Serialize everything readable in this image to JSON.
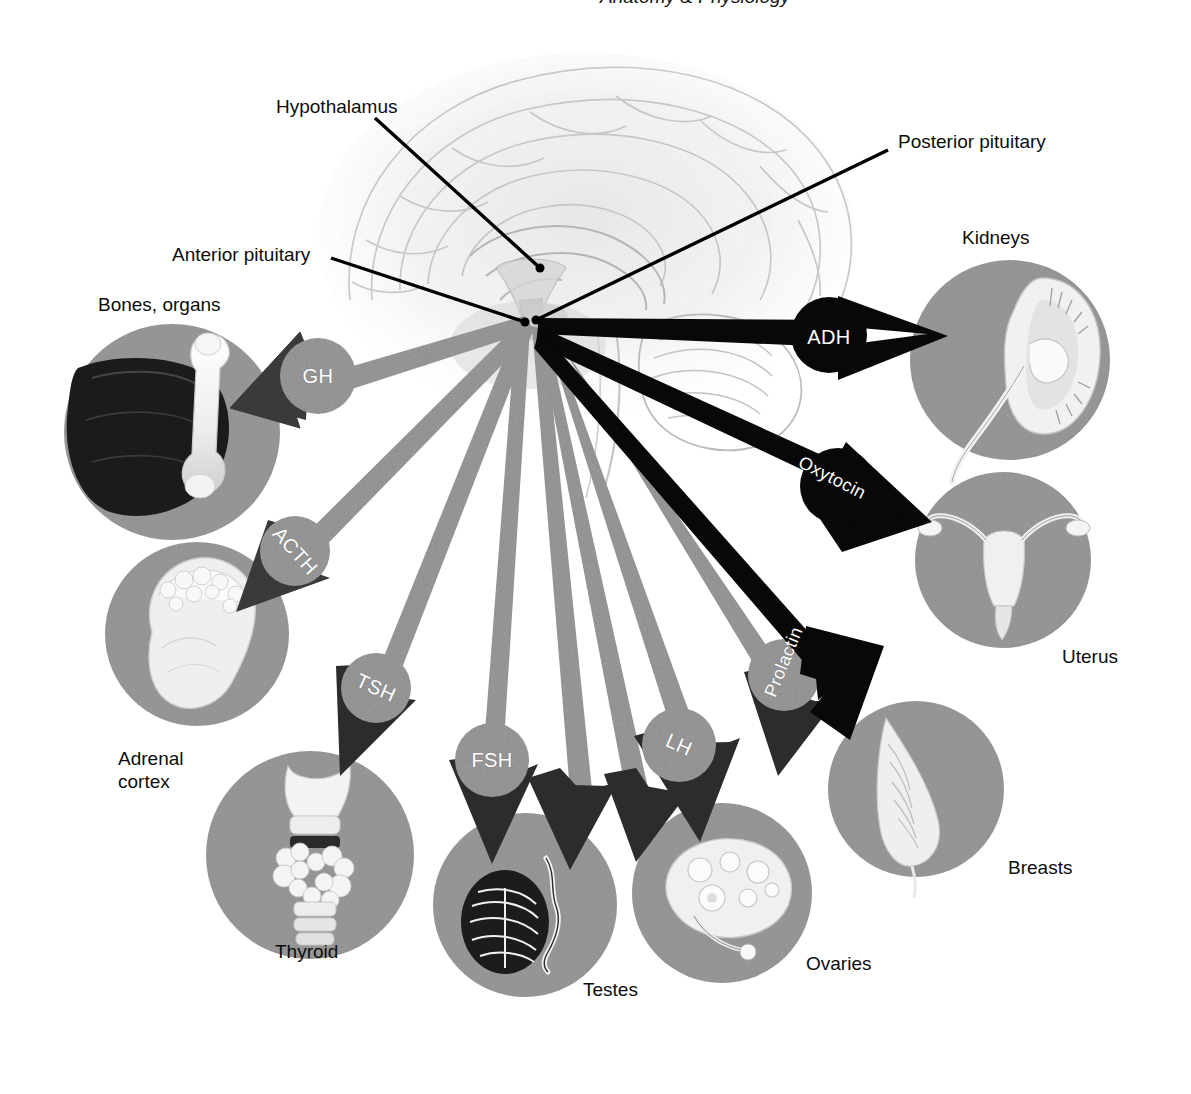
{
  "page": {
    "header_partial_text": "Anatomy & Physiology",
    "background_color": "#ffffff"
  },
  "palette": {
    "organ_circle_gray": "#919191",
    "anterior_shaft_gray": "#8e8e8e",
    "anterior_arrowhead": "#3a3a3a",
    "posterior_black": "#080808",
    "leader_line": "#000000",
    "label_text": "#0d0d0d",
    "hormone_text": "#ffffff"
  },
  "anatomy": {
    "brain_label": "brain-sagittal-section",
    "pituitary_hub": {
      "x": 530,
      "y": 322
    }
  },
  "leader_labels": [
    {
      "id": "hypothalamus",
      "text": "Hypothalamus",
      "x": 276,
      "y": 95,
      "line": {
        "x1": 375,
        "y1": 118,
        "x2": 540,
        "y2": 268
      }
    },
    {
      "id": "anterior-pituitary",
      "text": "Anterior pituitary",
      "x": 172,
      "y": 243,
      "line": {
        "x1": 331,
        "y1": 258,
        "x2": 525,
        "y2": 322
      }
    },
    {
      "id": "posterior-pituitary",
      "text": "Posterior pituitary",
      "x": 898,
      "y": 130,
      "line": {
        "x1": 888,
        "y1": 150,
        "x2": 536,
        "y2": 320
      }
    }
  ],
  "organs": [
    {
      "id": "bones-organs",
      "label": "Bones, organs",
      "label_x": 98,
      "label_y": 293,
      "cx": 172,
      "cy": 432,
      "r": 108,
      "art": "liver-and-femur"
    },
    {
      "id": "adrenal-cortex",
      "label": "Adrenal\ncortex",
      "label_x": 118,
      "label_y": 757,
      "cx": 197,
      "cy": 634,
      "r": 92,
      "art": "adrenal-gland-kidney"
    },
    {
      "id": "thyroid",
      "label": "Thyroid",
      "label_x": 275,
      "label_y": 940,
      "cx": 310,
      "cy": 855,
      "r": 104,
      "art": "thyroid-gland"
    },
    {
      "id": "testes",
      "label": "Testes",
      "label_x": 583,
      "label_y": 978,
      "cx": 525,
      "cy": 905,
      "r": 92,
      "art": "testis-epididymis"
    },
    {
      "id": "ovaries",
      "label": "Ovaries",
      "label_x": 806,
      "label_y": 952,
      "cx": 722,
      "cy": 893,
      "r": 90,
      "art": "ovary-follicles"
    },
    {
      "id": "breasts",
      "label": "Breasts",
      "label_x": 1008,
      "label_y": 856,
      "cx": 916,
      "cy": 789,
      "r": 88,
      "art": "breast-cross-section"
    },
    {
      "id": "uterus",
      "label": "Uterus",
      "label_x": 1062,
      "label_y": 645,
      "cx": 1003,
      "cy": 560,
      "r": 88,
      "art": "uterus-fallopian-tubes"
    },
    {
      "id": "kidneys",
      "label": "Kidneys",
      "label_x": 962,
      "label_y": 226,
      "cx": 1010,
      "cy": 360,
      "r": 100,
      "art": "kidney-cross-section"
    }
  ],
  "hormones": [
    {
      "id": "gh",
      "name": "GH",
      "source": "Anterior pituitary",
      "target": "Bones, organs",
      "style": "anterior",
      "capsule": {
        "cx": 318,
        "cy": 376,
        "r": 38
      },
      "text_rot": 0,
      "text_x": 318,
      "text_y": 376
    },
    {
      "id": "acth",
      "name": "ACTH",
      "source": "Anterior pituitary",
      "target": "Adrenal cortex",
      "style": "anterior",
      "capsule": {
        "cx": 295,
        "cy": 551,
        "r": 35
      },
      "text_rot": 48,
      "text_x": 295,
      "text_y": 551
    },
    {
      "id": "tsh",
      "name": "TSH",
      "source": "Anterior pituitary",
      "target": "Thyroid",
      "style": "anterior",
      "capsule": {
        "cx": 376,
        "cy": 688,
        "r": 35
      },
      "text_rot": 24,
      "text_x": 376,
      "text_y": 688
    },
    {
      "id": "fsh",
      "name": "FSH",
      "source": "Anterior pituitary",
      "target": "Testes, Ovaries",
      "style": "anterior",
      "capsule": {
        "cx": 492,
        "cy": 760,
        "r": 37
      },
      "text_rot": 0,
      "text_x": 492,
      "text_y": 760
    },
    {
      "id": "lh",
      "name": "LH",
      "source": "Anterior pituitary",
      "target": "Ovaries, Testes",
      "style": "anterior",
      "capsule": {
        "cx": 679,
        "cy": 745,
        "r": 37
      },
      "text_rot": 24,
      "text_x": 679,
      "text_y": 745
    },
    {
      "id": "prolactin",
      "name": "Prolactin",
      "source": "Anterior pituitary",
      "target": "Breasts",
      "style": "anterior",
      "capsule": {
        "cx": 784,
        "cy": 675,
        "r": 36
      },
      "text_rot": -68,
      "text_x": 784,
      "text_y": 662
    },
    {
      "id": "adh",
      "name": "ADH",
      "source": "Posterior pituitary",
      "target": "Kidneys",
      "style": "posterior",
      "capsule": {
        "cx": 829,
        "cy": 335,
        "r": 38
      },
      "text_rot": 0,
      "text_x": 829,
      "text_y": 337
    },
    {
      "id": "oxytocin",
      "name": "Oxytocin",
      "source": "Posterior pituitary",
      "target": "Uterus",
      "style": "posterior",
      "capsule": {
        "cx": 838,
        "cy": 486,
        "r": 38
      },
      "text_rot": 27,
      "text_x": 832,
      "text_y": 478
    }
  ]
}
